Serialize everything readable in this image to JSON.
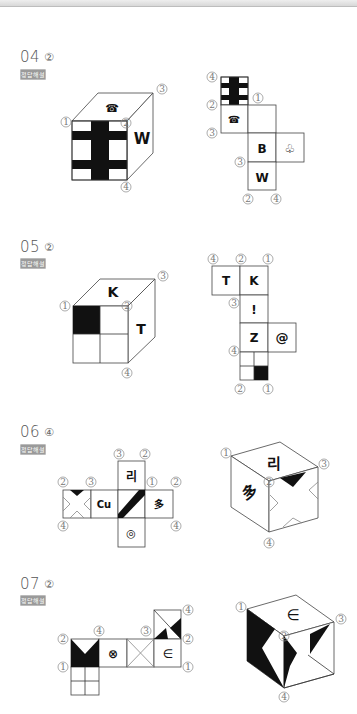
{
  "badge_label": "정답해설",
  "questions": [
    {
      "number": "04",
      "answer": "②",
      "cube": {
        "top_symbol": "☎",
        "right_letter": "W",
        "front_pattern": "cross-stripes",
        "corner_labels": [
          "①",
          "②",
          "③",
          "④"
        ]
      },
      "net": {
        "faces": [
          "cross-stripes",
          "☎",
          "blank",
          "B",
          "♧",
          "W"
        ],
        "corner_labels": [
          "④",
          "②",
          "①",
          "③",
          "③",
          "②",
          "④"
        ]
      }
    },
    {
      "number": "05",
      "answer": "②",
      "cube": {
        "top_letter": "K",
        "right_letter": "T",
        "front_pattern": "quad-top-left-black",
        "corner_labels": [
          "①",
          "②",
          "③",
          "④"
        ]
      },
      "net": {
        "faces": [
          "T",
          "K",
          "!",
          "Z",
          "@",
          "quad-bottom-right-black"
        ],
        "corner_labels": [
          "④",
          "②",
          "①",
          "③",
          "④",
          "②",
          "①"
        ]
      }
    },
    {
      "number": "06",
      "answer": "④",
      "net": {
        "faces": [
          "리",
          "X-pattern",
          "Cu",
          "diagonal-band",
          "多",
          "◎"
        ],
        "corner_labels": [
          "③",
          "②",
          "②",
          "③",
          "①",
          "②",
          "④",
          "④"
        ]
      },
      "cube": {
        "top_symbol": "리",
        "left_symbol": "多",
        "right_pattern": "X-with-black-triangle",
        "corner_labels": [
          "①",
          "②",
          "③",
          "④"
        ]
      }
    },
    {
      "number": "07",
      "answer": "②",
      "net": {
        "faces": [
          "V-black",
          "⊗",
          "X-lines",
          "∈",
          "triangles",
          "grid"
        ],
        "corner_labels": [
          "②",
          "④",
          "③",
          "④",
          "②",
          "①",
          "①"
        ]
      },
      "cube": {
        "top_symbol": "∈",
        "corner_labels": [
          "①",
          "②",
          "③",
          "④"
        ]
      }
    }
  ]
}
